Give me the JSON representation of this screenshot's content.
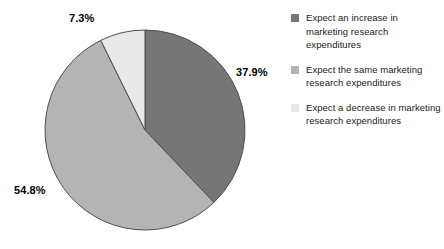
{
  "chart_data": {
    "type": "pie",
    "title": "",
    "xlabel": "",
    "ylabel": "",
    "categories": [
      "Expect an increase in marketing research expenditures",
      "Expect the same marketing research expenditures",
      "Expect a decrease in marketing research expenditures"
    ],
    "values": [
      37.9,
      54.8,
      7.3
    ],
    "value_labels": [
      "37.9%",
      "54.8%",
      "7.3%"
    ],
    "colors": [
      "#767676",
      "#b4b4b4",
      "#e8e8e8"
    ],
    "slice_border_color": "#4d4d4d",
    "start_angle_deg": 0,
    "direction": "clockwise",
    "legend_position": "right",
    "grid": false,
    "units": "percent"
  },
  "legend": {
    "items": [
      {
        "label": "Expect an increase in marketing research expenditures",
        "color": "#767676",
        "swatch_name": "legend-swatch-increase"
      },
      {
        "label": "Expect the same marketing research expenditures",
        "color": "#b4b4b4",
        "swatch_name": "legend-swatch-same"
      },
      {
        "label": "Expect a decrease in marketing research expenditures",
        "color": "#e8e8e8",
        "swatch_name": "legend-swatch-decrease"
      }
    ]
  }
}
